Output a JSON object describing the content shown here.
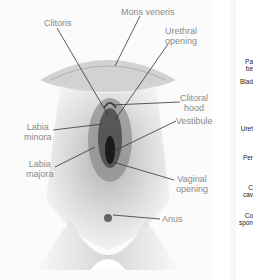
{
  "diagram": {
    "type": "anatomical-illustration",
    "labels": [
      {
        "id": "clitoris",
        "text": "Clitoris"
      },
      {
        "id": "mons",
        "text": "Mons veneris"
      },
      {
        "id": "urethral",
        "line1": "Urethral",
        "line2": "opening"
      },
      {
        "id": "clitoral-hood",
        "line1": "Clitoral",
        "line2": "hood"
      },
      {
        "id": "labia-minora",
        "line1": "Labia",
        "line2": "minora"
      },
      {
        "id": "vestibule",
        "text": "Vestibule"
      },
      {
        "id": "labia-majora",
        "line1": "Labia",
        "line2": "majora"
      },
      {
        "id": "vaginal",
        "line1": "Vaginal",
        "line2": "opening"
      },
      {
        "id": "anus",
        "text": "Anus"
      }
    ],
    "cropped_side_labels": [
      {
        "line1": "Pa",
        "line2": "be"
      },
      {
        "text": "Blad"
      },
      {
        "text": "Uret"
      },
      {
        "text": "Per"
      },
      {
        "line1": "C",
        "line2": "cav"
      },
      {
        "line1": "Co",
        "line2": "spon"
      }
    ],
    "colors": {
      "label_text": "#8a8a8a",
      "leader_line": "#333333",
      "side_label_text": "#222222"
    }
  }
}
